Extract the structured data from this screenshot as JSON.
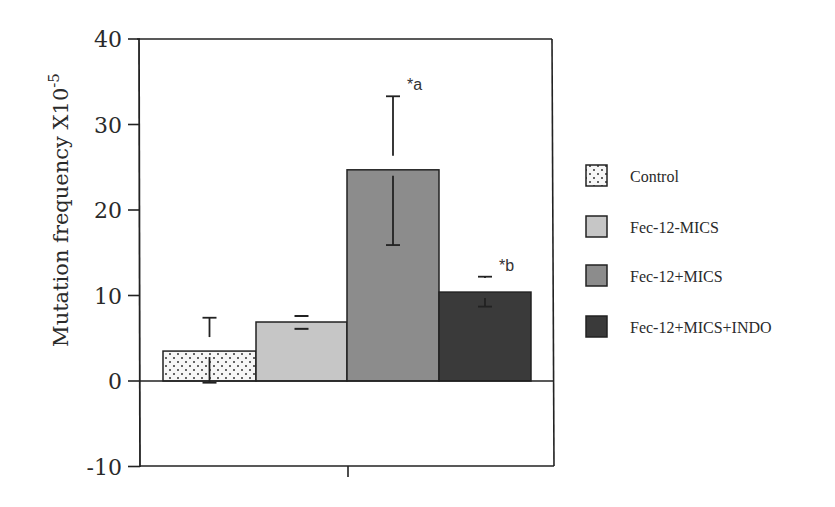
{
  "chart_data": {
    "type": "bar",
    "title": "",
    "xlabel": "",
    "ylabel": "Mutation frequency X10",
    "ylabel_superscript": "-5",
    "ylim": [
      -10,
      40
    ],
    "yticks": [
      40,
      30,
      20,
      10,
      0,
      -10
    ],
    "ytick_labels": [
      "40",
      "30",
      "20",
      "10",
      "0",
      "-10"
    ],
    "grid": false,
    "legend_position": "right",
    "categories": [
      "Control",
      "Fec-12-MICS",
      "Fec-12+MICS",
      "Fec-12+MICS+INDO"
    ],
    "values": [
      3.5,
      6.9,
      24.7,
      10.4
    ],
    "error_upper": [
      7.4,
      7.6,
      33.3,
      12.2
    ],
    "error_lower": [
      -0.2,
      6.1,
      15.9,
      8.7
    ],
    "annotations": [
      "",
      "",
      "*a",
      "*b"
    ],
    "series": [
      {
        "name": "Control",
        "value": 3.5,
        "fill": "dotted",
        "color": "#f4f4f4"
      },
      {
        "name": "Fec-12-MICS",
        "value": 6.9,
        "fill": "solid",
        "color": "#c4c4c4"
      },
      {
        "name": "Fec-12+MICS",
        "value": 24.7,
        "fill": "solid",
        "color": "#8a8a8a"
      },
      {
        "name": "Fec-12+MICS+INDO",
        "value": 10.4,
        "fill": "solid",
        "color": "#3c3c3c"
      }
    ]
  },
  "legend": {
    "items": [
      {
        "label": "Control"
      },
      {
        "label": "Fec-12-MICS"
      },
      {
        "label": "Fec-12+MICS"
      },
      {
        "label": "Fec-12+MICS+INDO"
      }
    ]
  }
}
